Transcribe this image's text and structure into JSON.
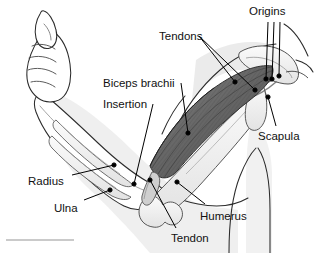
{
  "figure": {
    "type": "anatomical-illustration",
    "width": 314,
    "height": 253,
    "background": "#ffffff",
    "line_color": "#1a1a1a",
    "muscle_fill": "#6e6e6e",
    "muscle_shade_dark": "#4a4a4a",
    "bone_fill": "#f2f2f2",
    "skin_fill": "#ffffff",
    "soft_shadow": "#d8d8d8",
    "label_color": "#111111",
    "leader_color": "#000000"
  },
  "labels": [
    {
      "id": "origins",
      "text": "Origins",
      "x": 249,
      "y": 6,
      "anchor": "start"
    },
    {
      "id": "tendons",
      "text": "Tendons",
      "x": 159,
      "y": 31,
      "anchor": "start"
    },
    {
      "id": "biceps-brachii",
      "text": "Biceps brachii",
      "x": 103,
      "y": 78,
      "anchor": "start"
    },
    {
      "id": "insertion",
      "text": "Insertion",
      "x": 103,
      "y": 99,
      "anchor": "start"
    },
    {
      "id": "scapula",
      "text": "Scapula",
      "x": 258,
      "y": 131,
      "anchor": "start"
    },
    {
      "id": "radius",
      "text": "Radius",
      "x": 28,
      "y": 176,
      "anchor": "start"
    },
    {
      "id": "ulna",
      "text": "Ulna",
      "x": 54,
      "y": 203,
      "anchor": "start"
    },
    {
      "id": "humerus",
      "text": "Humerus",
      "x": 200,
      "y": 211,
      "anchor": "start"
    },
    {
      "id": "tendon",
      "text": "Tendon",
      "x": 171,
      "y": 233,
      "anchor": "start"
    }
  ],
  "leaders": [
    {
      "id": "origins-1",
      "from": [
        268,
        22
      ],
      "to": [
        266,
        79
      ],
      "dot": true
    },
    {
      "id": "origins-2",
      "from": [
        274,
        22
      ],
      "to": [
        272,
        79
      ],
      "dot": true
    },
    {
      "id": "origins-3",
      "from": [
        280,
        22
      ],
      "to": [
        279,
        76
      ],
      "dot": true
    },
    {
      "id": "tendons-1",
      "from": [
        199,
        36
      ],
      "to": [
        235,
        82
      ],
      "dot": true
    },
    {
      "id": "tendons-2",
      "from": [
        199,
        36
      ],
      "to": [
        255,
        90
      ],
      "dot": true
    },
    {
      "id": "biceps-1",
      "from": [
        181,
        83
      ],
      "to": [
        188,
        133
      ],
      "dot": true
    },
    {
      "id": "insertion-1",
      "from": [
        153,
        104
      ],
      "to": [
        134,
        184
      ],
      "dot": true
    },
    {
      "id": "scapula-1",
      "from": [
        276,
        126
      ],
      "to": [
        268,
        97
      ],
      "dot": true
    },
    {
      "id": "radius-1",
      "from": [
        72,
        175
      ],
      "to": [
        114,
        165
      ],
      "dot": true
    },
    {
      "id": "ulna-1",
      "from": [
        84,
        200
      ],
      "to": [
        110,
        190
      ],
      "dot": true
    },
    {
      "id": "humerus-1",
      "from": [
        205,
        204
      ],
      "to": [
        177,
        182
      ],
      "dot": true
    },
    {
      "id": "tendon-1",
      "from": [
        176,
        228
      ],
      "to": [
        150,
        180
      ],
      "dot": true
    }
  ],
  "structures": [
    {
      "id": "fist",
      "name": "clenched-fist"
    },
    {
      "id": "forearm",
      "name": "forearm-skin-outline"
    },
    {
      "id": "radius-bone",
      "name": "radius-bone"
    },
    {
      "id": "ulna-bone",
      "name": "ulna-bone"
    },
    {
      "id": "humerus-bone",
      "name": "humerus-bone"
    },
    {
      "id": "biceps-muscle",
      "name": "biceps-brachii-muscle"
    },
    {
      "id": "distal-tendon",
      "name": "distal-biceps-tendon"
    },
    {
      "id": "proximal-tendons",
      "name": "proximal-biceps-tendons"
    },
    {
      "id": "scapula-bone",
      "name": "scapula-bone"
    },
    {
      "id": "upper-arm",
      "name": "upper-arm-skin-outline"
    },
    {
      "id": "torso",
      "name": "torso-shoulder-outline"
    },
    {
      "id": "baseline-rule",
      "name": "bottom-left-rule"
    }
  ]
}
